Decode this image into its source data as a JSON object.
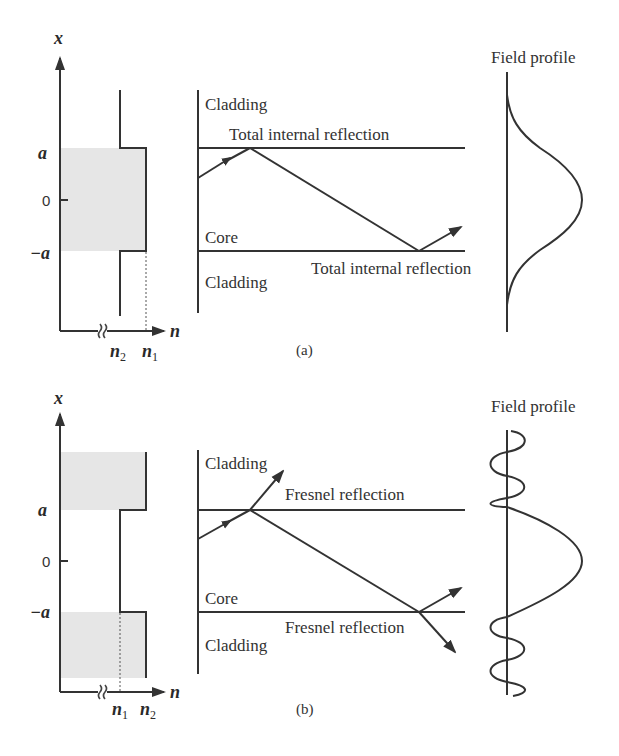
{
  "figure": {
    "panels": [
      {
        "id": "a",
        "caption": "(a)",
        "index_profile": {
          "x_axis_label": "x",
          "n_axis_label": "n",
          "tick_labels": [
            "a",
            "0",
            "−a"
          ],
          "n_labels": [
            "n",
            "2",
            "n",
            "1"
          ],
          "description": "Step index: core index n1 higher than cladding n2 (shaded core region)"
        },
        "ray_diagram": {
          "region_labels": [
            "Cladding",
            "Core",
            "Cladding"
          ],
          "reflection_labels": [
            "Total internal reflection",
            "Total internal reflection"
          ]
        },
        "field_profile": {
          "title": "Field profile",
          "shape": "gaussian-like confined mode"
        }
      },
      {
        "id": "b",
        "caption": "(b)",
        "index_profile": {
          "x_axis_label": "x",
          "n_axis_label": "n",
          "tick_labels": [
            "a",
            "0",
            "−a"
          ],
          "n_labels": [
            "n",
            "1",
            "n",
            "2"
          ],
          "description": "Anti-guide: core index n1 lower than cladding n2 (shaded cladding regions)"
        },
        "ray_diagram": {
          "region_labels": [
            "Cladding",
            "Core",
            "Cladding"
          ],
          "reflection_labels": [
            "Fresnel reflection",
            "Fresnel reflection"
          ]
        },
        "field_profile": {
          "title": "Field profile",
          "shape": "central lobe with oscillating leaky tails"
        }
      }
    ],
    "colors": {
      "line": "#333333",
      "shade": "#e6e6e6",
      "background": "#ffffff"
    }
  }
}
